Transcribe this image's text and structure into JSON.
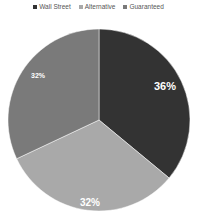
{
  "chart_data": {
    "type": "pie",
    "title": "",
    "categories": [
      "Wall Street",
      "Alternative",
      "Guaranteed"
    ],
    "values": [
      36,
      32,
      32
    ],
    "labels": [
      "36%",
      "32%",
      "32%"
    ],
    "colors": [
      "#333333",
      "#a9a9a9",
      "#7a7a7a"
    ],
    "legend_position": "top",
    "start_angle_deg": 0,
    "direction": "clockwise"
  },
  "legend": {
    "items": [
      {
        "label": "Wall Street",
        "color": "#333333"
      },
      {
        "label": "Alternative",
        "color": "#a9a9a9"
      },
      {
        "label": "Guaranteed",
        "color": "#7a7a7a"
      }
    ]
  },
  "slices": [
    {
      "label": "36%"
    },
    {
      "label": "32%"
    },
    {
      "label": "32%"
    }
  ]
}
